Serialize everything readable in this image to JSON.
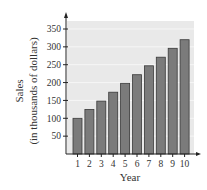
{
  "chart_data": {
    "type": "bar",
    "title": "",
    "xlabel": "Year",
    "ylabel": "Sales",
    "ylabel_sub": "(in thousands of dollars)",
    "categories": [
      "1",
      "2",
      "3",
      "4",
      "5",
      "6",
      "7",
      "8",
      "9",
      "10"
    ],
    "values": [
      100,
      125,
      148,
      173,
      198,
      222,
      247,
      271,
      296,
      320
    ],
    "ylim": [
      0,
      350
    ],
    "yticks": [
      50,
      100,
      150,
      200,
      250,
      300,
      350
    ],
    "grid": true,
    "legend": null,
    "colors": {
      "bar_fill": "#7b7b7b",
      "bar_stroke": "#3a3a3a",
      "plot_bg": "#e9e9e9",
      "grid": "#f6f6f6",
      "axis": "#222222"
    }
  }
}
